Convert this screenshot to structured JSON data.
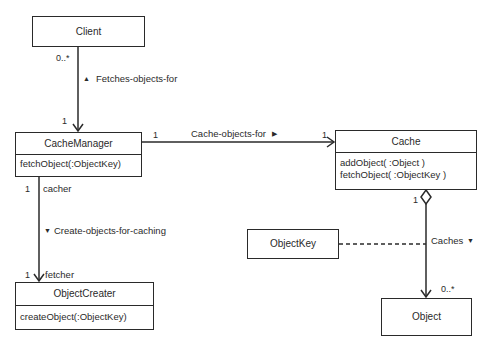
{
  "diagram": {
    "type": "UML class diagram",
    "classes": {
      "client": {
        "name": "Client"
      },
      "cache_manager": {
        "name": "CacheManager",
        "operations": [
          "fetchObject(:ObjectKey)"
        ]
      },
      "object_creater": {
        "name": "ObjectCreater",
        "operations": [
          "createObject(:ObjectKey)"
        ]
      },
      "cache": {
        "name": "Cache",
        "operations": [
          "addObject( :Object )",
          "fetchObject( :ObjectKey )"
        ]
      },
      "object_key": {
        "name": "ObjectKey"
      },
      "object": {
        "name": "Object"
      }
    },
    "associations": {
      "fetches": {
        "label": "Fetches-objects-for",
        "direction_glyph": "▲",
        "client_mult": "0..*",
        "manager_mult": "1"
      },
      "cache_objects": {
        "label": "Cache-objects-for",
        "direction_glyph": "▶",
        "manager_mult": "1",
        "cache_mult": "1"
      },
      "create": {
        "label": "Create-objects-for-caching",
        "direction_glyph": "▼",
        "manager_mult": "1",
        "manager_role": "cacher",
        "creater_mult": "1",
        "creater_role": "fetcher"
      },
      "caches": {
        "label": "Caches",
        "direction_glyph": "▼",
        "cache_mult": "1",
        "object_mult": "0..*"
      }
    }
  }
}
